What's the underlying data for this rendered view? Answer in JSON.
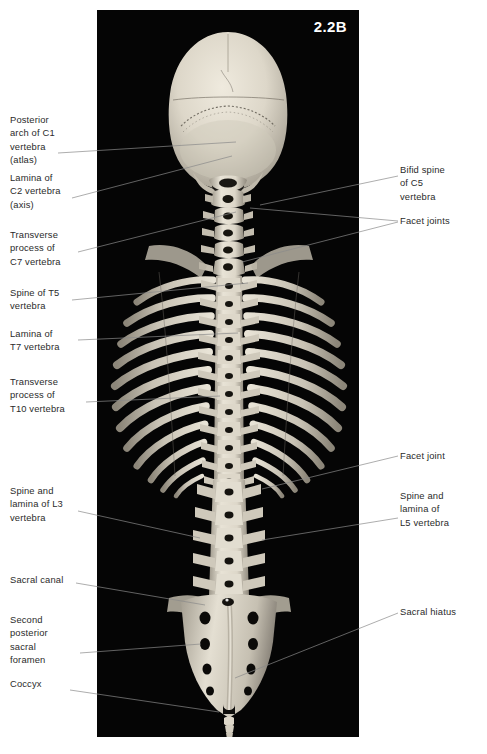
{
  "figure": {
    "number": "2.2B",
    "plate_background": "#050505",
    "label_color": "#2b2b2b",
    "leader_color": "#8a8a8a",
    "bone_color": "#d9d4c8"
  },
  "labels_left": [
    {
      "id": "posterior-arch-c1",
      "text": "Posterior\narch of C1\nvertebra\n(atlas)",
      "x": 10,
      "y": 113
    },
    {
      "id": "lamina-c2",
      "text": "Lamina of\nC2 vertebra\n(axis)",
      "x": 10,
      "y": 171
    },
    {
      "id": "transverse-c7",
      "text": "Transverse\nprocess of\nC7 vertebra",
      "x": 10,
      "y": 228
    },
    {
      "id": "spine-t5",
      "text": "Spine of T5\nvertebra",
      "x": 10,
      "y": 286
    },
    {
      "id": "lamina-t7",
      "text": "Lamina of\nT7 vertebra",
      "x": 10,
      "y": 327
    },
    {
      "id": "transverse-t10",
      "text": "Transverse\nprocess of\nT10 vertebra",
      "x": 10,
      "y": 375
    },
    {
      "id": "spine-lamina-l3",
      "text": "Spine and\nlamina of L3\nvertebra",
      "x": 10,
      "y": 484
    },
    {
      "id": "sacral-canal",
      "text": "Sacral canal",
      "x": 10,
      "y": 573
    },
    {
      "id": "second-foramen",
      "text": "Second\nposterior\nsacral\nforamen",
      "x": 10,
      "y": 613
    },
    {
      "id": "coccyx",
      "text": "Coccyx",
      "x": 10,
      "y": 677
    }
  ],
  "labels_right": [
    {
      "id": "bifid-spine-c5",
      "text": "Bifid spine\nof C5\nvertebra",
      "x": 410,
      "y": 163
    },
    {
      "id": "facet-joints",
      "text": "Facet joints",
      "x": 410,
      "y": 214
    },
    {
      "id": "facet-joint",
      "text": "Facet joint",
      "x": 410,
      "y": 449
    },
    {
      "id": "spine-lamina-l5",
      "text": "Spine and\nlamina of\nL5 vertebra",
      "x": 410,
      "y": 489
    },
    {
      "id": "sacral-hiatus",
      "text": "Sacral hiatus",
      "x": 410,
      "y": 605
    }
  ],
  "leader_lines": [
    {
      "id": "leader-posterior-arch-c1",
      "points": "58,153 236,142"
    },
    {
      "id": "leader-lamina-c2",
      "points": "72,198 232,156"
    },
    {
      "id": "leader-transverse-c7",
      "points": "78,252 236,212"
    },
    {
      "id": "leader-spine-t5",
      "points": "72,300 248,283"
    },
    {
      "id": "leader-lamina-t7",
      "points": "78,340 238,333"
    },
    {
      "id": "leader-transverse-t10",
      "points": "86,402 220,396"
    },
    {
      "id": "leader-spine-lamina-l3",
      "points": "78,511 200,538"
    },
    {
      "id": "leader-sacral-canal",
      "points": "76,583 205,605"
    },
    {
      "id": "leader-second-foramen",
      "points": "80,653 201,644"
    },
    {
      "id": "leader-coccyx",
      "points": "70,690 219,712"
    },
    {
      "id": "leader-bifid-spine-c5",
      "points": "398,176 260,205"
    },
    {
      "id": "leader-facet-joints-a",
      "points": "398,221 250,208"
    },
    {
      "id": "leader-facet-joints-b",
      "points": "398,222 242,262"
    },
    {
      "id": "leader-facet-joint",
      "points": "398,456 262,489"
    },
    {
      "id": "leader-spine-lamina-l5",
      "points": "398,518 262,540"
    },
    {
      "id": "leader-sacral-hiatus",
      "points": "398,613 235,678"
    }
  ],
  "photo": {
    "alt": "Posterior view of articulated human skull, vertebral column, rib cage and sacrum",
    "plate": {
      "x": 97,
      "y": 10,
      "width": 262,
      "height": 727
    }
  }
}
